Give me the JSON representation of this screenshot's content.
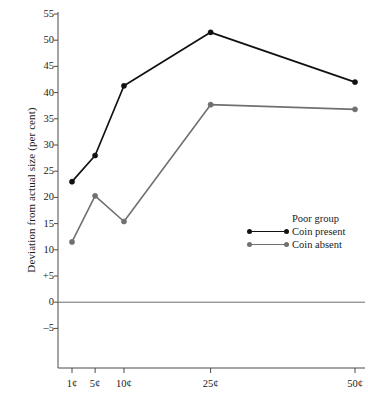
{
  "chart_data": {
    "type": "line",
    "title": "",
    "subtitle": "",
    "xlabel": "",
    "ylabel": "Deviation from actual size (per cent)",
    "categories": [
      "1¢",
      "5¢",
      "10¢",
      "25¢",
      "50¢"
    ],
    "x": [
      1,
      5,
      10,
      25,
      50
    ],
    "xlim": [
      0,
      53
    ],
    "ylim": [
      -7.5,
      56.5
    ],
    "yticks": [
      55,
      50,
      45,
      40,
      35,
      30,
      25,
      20,
      15,
      10,
      5,
      0,
      -5
    ],
    "ytick_labels": [
      "55",
      "50",
      "45",
      "40",
      "35",
      "30",
      "25",
      "20",
      "15",
      "10",
      "+5",
      "0",
      "–5"
    ],
    "grid": false,
    "zero_line": true,
    "legend_position": "center-right",
    "legend_title": "Poor group",
    "series": [
      {
        "name": "Coin present",
        "color": "#111111",
        "marker": "circle",
        "values": [
          23.0,
          28.0,
          41.3,
          51.5,
          42.0
        ]
      },
      {
        "name": "Coin absent",
        "color": "#707070",
        "marker": "circle",
        "values": [
          11.5,
          20.3,
          15.4,
          37.7,
          36.8
        ]
      }
    ]
  },
  "axes": {
    "y_title": "Deviation from actual size (per cent)"
  },
  "legend": {
    "title": "Poor group",
    "entries": [
      {
        "label": "Coin present",
        "color": "#111111"
      },
      {
        "label": "Coin absent",
        "color": "#707070"
      }
    ]
  }
}
